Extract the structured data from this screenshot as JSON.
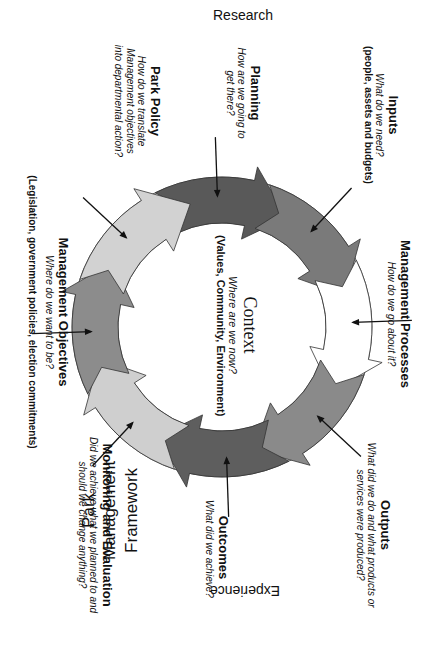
{
  "diagram": {
    "title_lines": [
      "Park",
      "Management",
      "Framework"
    ],
    "axis_top": "Research",
    "axis_bottom": "Experience",
    "center": {
      "title": "Context",
      "question": "Where are we now?",
      "detail": "(Values, Community, Environment)"
    },
    "stages": [
      {
        "id": "planning",
        "title": "Planning",
        "question_lines": [
          "How are we going to",
          "get there?"
        ],
        "detail": "",
        "color": "#595959"
      },
      {
        "id": "inputs",
        "title": "Inputs",
        "question_lines": [
          "What do we need?"
        ],
        "detail": "(people, assets and budgets)",
        "color": "#7a7a7a"
      },
      {
        "id": "management-processes",
        "title": "Management Processes",
        "question_lines": [
          "How do we go about it?"
        ],
        "detail": "",
        "color": "#ffffff"
      },
      {
        "id": "outputs",
        "title": "Outputs",
        "question_lines": [
          "What did we do and what products or",
          "services were produced?"
        ],
        "detail": "",
        "color": "#8a8a8a"
      },
      {
        "id": "outcomes",
        "title": "Outcomes",
        "question_lines": [
          "What did we achieve?"
        ],
        "detail": "",
        "color": "#5e5e5e"
      },
      {
        "id": "monitoring-evaluation",
        "title": "Monitoring and Evaluation",
        "question_lines": [
          "Did we achieve what we planned to and",
          "should we change anything?"
        ],
        "detail": "",
        "color": "#cfcfcf"
      },
      {
        "id": "management-objectives",
        "title": "Management Objectives",
        "question_lines": [
          "Where do we want to be?"
        ],
        "detail": "(Legislation, government policies, election commitments)",
        "color": "#8c8c8c"
      },
      {
        "id": "park-policy",
        "title": "Park Policy",
        "question_lines": [
          "How do we translate",
          "Management objectives",
          "into departmental action?"
        ],
        "detail": "",
        "color": "#d2d2d2"
      }
    ]
  }
}
